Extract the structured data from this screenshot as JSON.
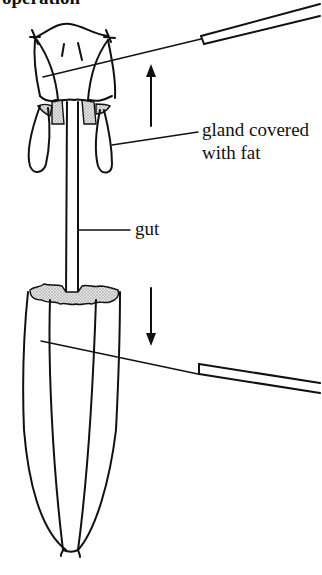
{
  "figure": {
    "caption_partial": "operation",
    "labels": {
      "gland": [
        "gland covered",
        "with fat"
      ],
      "gut": "gut"
    },
    "arrows": [
      {
        "name": "pull-head-up",
        "direction": "up"
      },
      {
        "name": "pull-abdomen-down",
        "direction": "down"
      }
    ],
    "colors": {
      "ink": "#111111",
      "fat_stipple": "#bdbdbd",
      "background": "#ffffff"
    }
  }
}
